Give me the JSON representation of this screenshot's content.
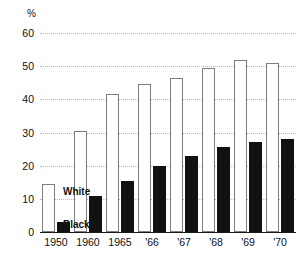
{
  "chart_data": {
    "type": "bar",
    "title": "",
    "subtitle": "",
    "xlabel": "",
    "ylabel": "%",
    "unit_label": "%",
    "categories": [
      "1950",
      "1960",
      "1965",
      "'66",
      "'67",
      "'68",
      "'69",
      "'70"
    ],
    "series": [
      {
        "name": "White",
        "color": "#ffffff",
        "edge_color": "#7d7d7d",
        "values": [
          14.5,
          30.5,
          41.5,
          44.5,
          46.5,
          49.5,
          52.0,
          51.0
        ]
      },
      {
        "name": "Black",
        "color": "#111111",
        "edge_color": "#111111",
        "values": [
          3.0,
          11.0,
          15.5,
          20.0,
          23.0,
          25.5,
          27.0,
          28.0
        ]
      }
    ],
    "ylim": [
      0,
      60
    ],
    "yticks": [
      0,
      10,
      20,
      30,
      40,
      50,
      60
    ],
    "ytick_labels": [
      "0",
      "10",
      "20",
      "30",
      "40",
      "50",
      "60"
    ],
    "grid": true,
    "grid_style": "dotted",
    "grid_color": "#b9b9b9",
    "legend": {
      "position": "inline-first-group",
      "entries": [
        {
          "label": "White",
          "swatch": "white"
        },
        {
          "label": "Black",
          "swatch": "black"
        }
      ]
    },
    "axis_color": "#1a1a1a",
    "background": "#ffffff"
  }
}
